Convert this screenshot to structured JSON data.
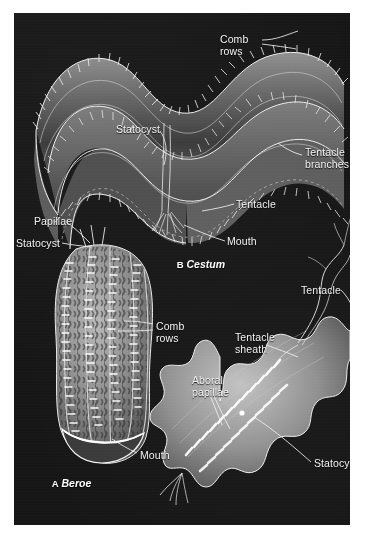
{
  "figure": {
    "background_color": "#161616",
    "margin_color": "#ffffff",
    "label_color": "#f2f2f2",
    "panels": [
      {
        "letter": "A",
        "genus": "Beroe",
        "caption_x": 26,
        "caption_y": 452,
        "labels": [
          {
            "name": "papillae",
            "text": "Papillae",
            "x": 20,
            "y": 203
          },
          {
            "name": "statocyst",
            "text": "Statocyst",
            "x": 2,
            "y": 225
          },
          {
            "name": "comb-rows",
            "text": "Comb\nrows",
            "x": 142,
            "y": 308
          },
          {
            "name": "mouth",
            "text": "Mouth",
            "x": 126,
            "y": 437
          }
        ]
      },
      {
        "letter": "B",
        "genus": "Cestum",
        "caption_x": 151,
        "caption_y": 233,
        "labels": [
          {
            "name": "comb-rows",
            "text": "Comb\nrows",
            "x": 206,
            "y": 21
          },
          {
            "name": "statocyst",
            "text": "Statocyst",
            "x": 102,
            "y": 111
          },
          {
            "name": "tentacle-branches",
            "text": "Tentacle\nbranches",
            "x": 291,
            "y": 134
          },
          {
            "name": "tentacle",
            "text": "Tentacle",
            "x": 222,
            "y": 186
          },
          {
            "name": "mouth",
            "text": "Mouth",
            "x": 213,
            "y": 223
          }
        ]
      },
      {
        "letter": "C",
        "genus": "Coeloplana",
        "caption_x": 253,
        "caption_y": 505,
        "labels": [
          {
            "name": "tentacle",
            "text": "Tentacle",
            "x": 287,
            "y": 272
          },
          {
            "name": "tentacle-sheath",
            "text": "Tentacle\nsheath",
            "x": 221,
            "y": 319
          },
          {
            "name": "aboral-papillae",
            "text": "Aboral\npapillae",
            "x": 178,
            "y": 362
          },
          {
            "name": "statocyst",
            "text": "Statocyst",
            "x": 300,
            "y": 445
          }
        ]
      }
    ]
  }
}
